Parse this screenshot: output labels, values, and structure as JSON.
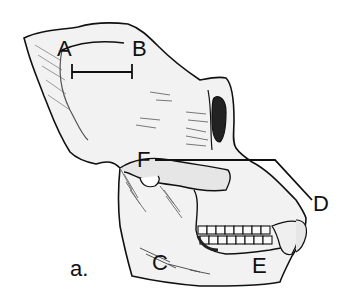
{
  "figure": {
    "panel_label": "a.",
    "labels": {
      "A": "A",
      "B": "B",
      "C": "C",
      "D": "D",
      "E": "E",
      "F": "F"
    },
    "scale_bar": {
      "from": "A",
      "to": "B"
    },
    "colors": {
      "ink": "#111111",
      "bone_fill": "#f2f2f2",
      "shade": "#bdbdbd",
      "background": "#ffffff"
    }
  }
}
